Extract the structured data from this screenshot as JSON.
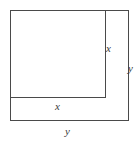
{
  "figure": {
    "type": "geometry-diagram",
    "canvas": {
      "width": 139,
      "height": 146
    },
    "background_color": "#ffffff",
    "stroke_color": "#4a4a4a",
    "stroke_width": 1,
    "label_color": "#3a3a3a",
    "shapes": {
      "outer_square": {
        "name": "outer-square",
        "x": 10,
        "y": 10,
        "width": 118,
        "height": 110,
        "side_label": "y"
      },
      "inner_square": {
        "name": "inner-square",
        "x": 10,
        "y": 10,
        "width": 95,
        "height": 87,
        "side_label": "x"
      }
    },
    "labels": {
      "x_right": "x",
      "y_right": "y",
      "x_bottom": "x",
      "y_bottom": "y"
    }
  }
}
